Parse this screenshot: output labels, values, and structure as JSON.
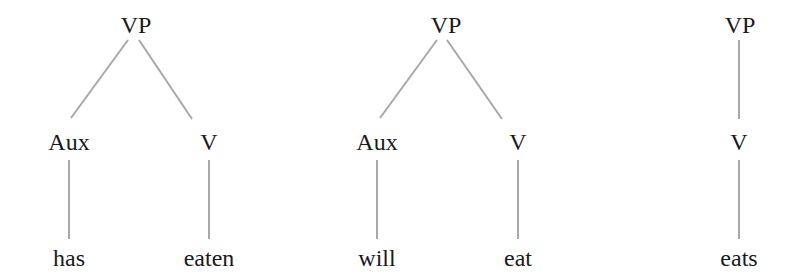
{
  "trees": [
    {
      "nodes": [
        {
          "id": "vp",
          "label": "VP",
          "x": 136,
          "y": 25
        },
        {
          "id": "aux",
          "label": "Aux",
          "x": 69,
          "y": 142
        },
        {
          "id": "v",
          "label": "V",
          "x": 209,
          "y": 142
        },
        {
          "id": "aux-leaf",
          "label": "has",
          "x": 69,
          "y": 258
        },
        {
          "id": "v-leaf",
          "label": "eaten",
          "x": 209,
          "y": 258
        }
      ],
      "edges": [
        {
          "x1": 128,
          "y1": 40,
          "x2": 71,
          "y2": 118
        },
        {
          "x1": 139,
          "y1": 40,
          "x2": 192,
          "y2": 119
        },
        {
          "x1": 69,
          "y1": 160,
          "x2": 69,
          "y2": 239
        },
        {
          "x1": 209,
          "y1": 160,
          "x2": 209,
          "y2": 239
        }
      ]
    },
    {
      "nodes": [
        {
          "id": "vp",
          "label": "VP",
          "x": 446,
          "y": 25
        },
        {
          "id": "aux",
          "label": "Aux",
          "x": 377,
          "y": 142
        },
        {
          "id": "v",
          "label": "V",
          "x": 518,
          "y": 142
        },
        {
          "id": "aux-leaf",
          "label": "will",
          "x": 377,
          "y": 258
        },
        {
          "id": "v-leaf",
          "label": "eat",
          "x": 518,
          "y": 258
        }
      ],
      "edges": [
        {
          "x1": 437,
          "y1": 40,
          "x2": 380,
          "y2": 118
        },
        {
          "x1": 447,
          "y1": 40,
          "x2": 502,
          "y2": 119
        },
        {
          "x1": 377,
          "y1": 160,
          "x2": 377,
          "y2": 239
        },
        {
          "x1": 518,
          "y1": 160,
          "x2": 518,
          "y2": 239
        }
      ]
    },
    {
      "nodes": [
        {
          "id": "vp",
          "label": "VP",
          "x": 740,
          "y": 25
        },
        {
          "id": "v",
          "label": "V",
          "x": 739,
          "y": 142
        },
        {
          "id": "v-leaf",
          "label": "eats",
          "x": 739,
          "y": 258
        }
      ],
      "edges": [
        {
          "x1": 739,
          "y1": 40,
          "x2": 739,
          "y2": 119
        },
        {
          "x1": 739,
          "y1": 160,
          "x2": 739,
          "y2": 239
        }
      ]
    }
  ],
  "colors": {
    "edge": "#a8a8a8",
    "text": "#1a1a1a",
    "background": "#ffffff"
  }
}
